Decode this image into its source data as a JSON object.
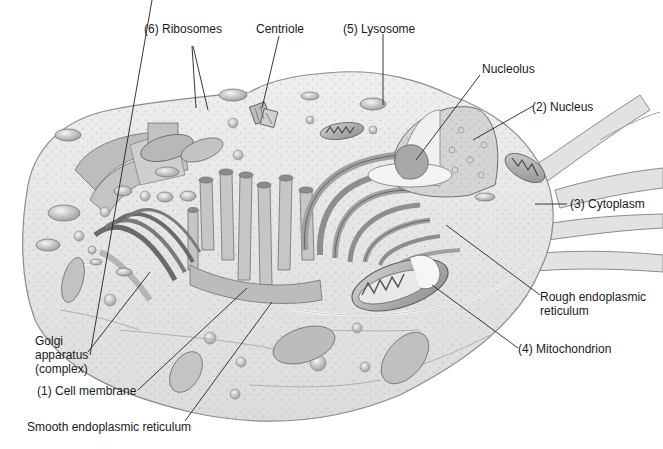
{
  "diagram": {
    "title": "",
    "colors": {
      "background": "#ffffff",
      "cell_fill": "#e6e6e6",
      "cell_stroke": "#8c8c8c",
      "organelle_fill": "#c9c9c9",
      "organelle_dark": "#9a9a9a",
      "nucleus_fill": "#d7d7d7",
      "leader_line": "#222222",
      "text": "#1a1a1a"
    },
    "labels": {
      "ribosomes": "(6) Ribosomes",
      "centriole": "Centriole",
      "lysosome": "(5) Lysosome",
      "nucleolus": "Nucleolus",
      "nucleus": "(2) Nucleus",
      "cytoplasm": "(3) Cytoplasm",
      "rough_er_line1": "Rough endoplasmic",
      "rough_er_line2": "reticulum",
      "mitochondrion": "(4) Mitochondrion",
      "golgi_line1": "Golgi",
      "golgi_line2": "apparatus",
      "golgi_line3": "(complex)",
      "cell_membrane": "(1) Cell membrane",
      "smooth_er": "Smooth endoplasmic reticulum"
    }
  }
}
